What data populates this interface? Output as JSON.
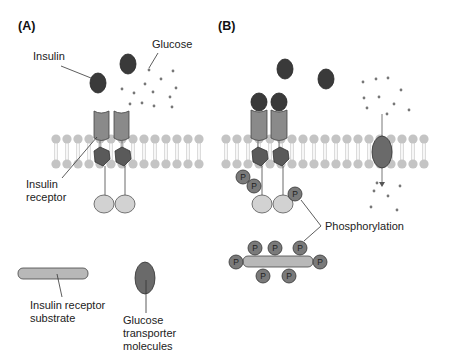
{
  "panels": {
    "a": {
      "label": "(A)"
    },
    "b": {
      "label": "(B)"
    }
  },
  "labels": {
    "insulin": "Insulin",
    "glucose": "Glucose",
    "insulin_receptor_line1": "Insulin",
    "insulin_receptor_line2": "receptor",
    "irs_line1": "Insulin receptor",
    "irs_line2": "substrate",
    "glut_line1": "Glucose",
    "glut_line2": "transporter",
    "glut_line3": "molecules",
    "phosphorylation": "Phosphorylation"
  },
  "phosphate_symbol": "P",
  "colors": {
    "insulin": "#3a3a3a",
    "receptor": "#8a8a8a",
    "kinase": "#5a5a5a",
    "lipid": "#c4c4c4",
    "globule": "#d2d2d2",
    "phosphate": "#7a7a7a",
    "glucose": "#777777",
    "irs": "#b8b8b8",
    "transporter": "#6a6a6a"
  }
}
